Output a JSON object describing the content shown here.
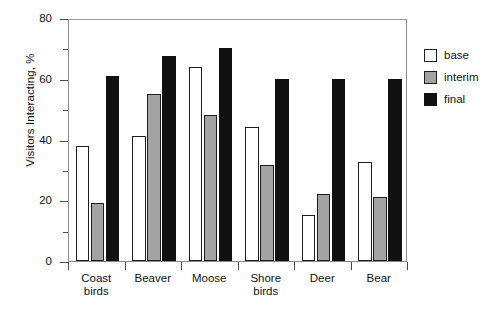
{
  "chart_data": {
    "type": "bar",
    "title": "",
    "subtitle": "",
    "xlabel": "",
    "ylabel": "Visitors Interacting, %",
    "categories": [
      "Coast birds",
      "Beaver",
      "Moose",
      "Shore birds",
      "Deer",
      "Bear"
    ],
    "category_lines": [
      [
        "Coast",
        "birds"
      ],
      [
        "Beaver"
      ],
      [
        "Moose"
      ],
      [
        "Shore",
        "birds"
      ],
      [
        "Deer"
      ],
      [
        "Bear"
      ]
    ],
    "series": [
      {
        "name": "base",
        "color": "#ffffff",
        "values": [
          38,
          41,
          64,
          44,
          15,
          32.5
        ]
      },
      {
        "name": "interim",
        "color": "#a3a3a3",
        "values": [
          19,
          55,
          48,
          31.5,
          22,
          21
        ]
      },
      {
        "name": "final",
        "color": "#111111",
        "values": [
          61,
          67.5,
          70,
          60,
          60,
          60
        ]
      }
    ],
    "ylim": [
      0,
      80
    ],
    "ytick_major": [
      0,
      20,
      40,
      60,
      80
    ],
    "ytick_minor": [
      10,
      30,
      50,
      70
    ],
    "ytick_labels": [
      "0",
      "20",
      "40",
      "60",
      "80"
    ],
    "grid": false,
    "legend_position": "right",
    "legend_entries": [
      "base",
      "interim",
      "final"
    ],
    "frame_color": "#8a8a8a",
    "bar_edge_color": "#1d1d1d"
  }
}
